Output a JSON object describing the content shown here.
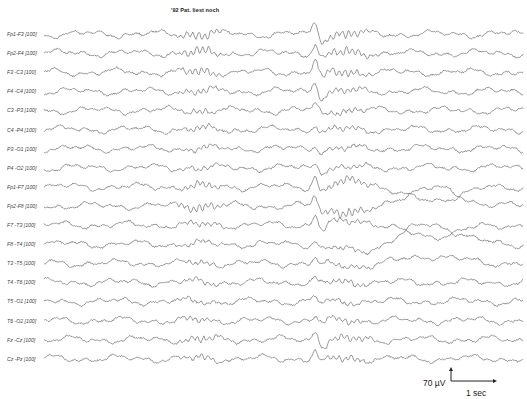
{
  "title": "'92  Pat. liest noch",
  "chart_data": {
    "type": "line",
    "title": "'92  Pat. liest noch",
    "subtype": "eeg-montage",
    "xlabel": "time",
    "ylabel": "amplitude",
    "grid": false,
    "legend": "none",
    "channels": [
      {
        "label": "Fp1-F3 [100]",
        "spike": 1.0,
        "alpha": 0.9,
        "slow": 0.0
      },
      {
        "label": "Fp2-F4 [100]",
        "spike": 1.0,
        "alpha": 0.9,
        "slow": 0.0
      },
      {
        "label": "F3 -C3 [100]",
        "spike": 1.2,
        "alpha": 0.8,
        "slow": 0.0
      },
      {
        "label": "F4 -C4 [100]",
        "spike": 1.0,
        "alpha": 0.6,
        "slow": 0.0
      },
      {
        "label": "C3 -P3 [100]",
        "spike": 0.6,
        "alpha": 0.5,
        "slow": 0.0
      },
      {
        "label": "C4 -P4 [100]",
        "spike": 0.6,
        "alpha": 0.5,
        "slow": 0.0
      },
      {
        "label": "P3 -O1 [100]",
        "spike": 0.4,
        "alpha": 0.4,
        "slow": 0.0
      },
      {
        "label": "P4 -O2 [100]",
        "spike": 0.4,
        "alpha": 0.4,
        "slow": 0.0
      },
      {
        "label": "Fp1-F7 [100]",
        "spike": 1.0,
        "alpha": 0.8,
        "slow": 1.0
      },
      {
        "label": "Fp2-F8 [100]",
        "spike": 1.1,
        "alpha": 1.0,
        "slow": -1.3
      },
      {
        "label": "F7 -T3 [100]",
        "spike": 0.9,
        "alpha": 0.5,
        "slow": 0.8
      },
      {
        "label": "F8 -T4 [100]",
        "spike": 0.5,
        "alpha": 0.4,
        "slow": -1.4
      },
      {
        "label": "T3 -T5 [100]",
        "spike": 0.4,
        "alpha": 0.4,
        "slow": -0.5
      },
      {
        "label": "T4 -T6 [100]",
        "spike": 0.3,
        "alpha": 0.5,
        "slow": 0.0
      },
      {
        "label": "T5 -O1 [100]",
        "spike": 0.3,
        "alpha": 0.4,
        "slow": 0.0
      },
      {
        "label": "T6 -O2 [100]",
        "spike": 0.4,
        "alpha": 0.5,
        "slow": 0.0
      },
      {
        "label": "Fz -Cz [100]",
        "spike": 0.9,
        "alpha": 0.7,
        "slow": 0.0
      },
      {
        "label": "Cz -Pz [100]",
        "spike": 0.8,
        "alpha": 0.6,
        "slow": 0.0
      }
    ],
    "annotations": {
      "event_x_px": 315,
      "scale_amplitude": "70 µV",
      "scale_time": "1 sec"
    }
  },
  "scale": {
    "amplitude_label": "70 µV",
    "time_label": "1 sec"
  },
  "colors": {
    "trace": "#555555",
    "label": "#444444",
    "scale": "#222222"
  }
}
